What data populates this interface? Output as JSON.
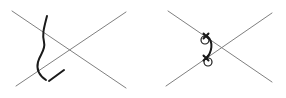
{
  "figure": {
    "title": "Two hand-drawn X-crossing diagrams",
    "background_color": "#ffffff",
    "width": 286,
    "height": 98,
    "panel_count": 2
  },
  "style": {
    "line_color": "#808080",
    "stroke_color": "#1a1a1a",
    "circle_stroke_color": "#1a1a1a",
    "circle_fill": "none",
    "line_width": 1.0,
    "stroke_width": 2.0,
    "circle_radius": 4.0
  },
  "panels": [
    {
      "id": "left-panel",
      "name": "wavy-stroke-panel",
      "label": "Left diagram: X crossing with wavy vertical stroke",
      "cross": {
        "name": "x-cross-left",
        "lines": [
          {
            "name": "descending-line",
            "x1": 12,
            "y1": 11,
            "x2": 126,
            "y2": 88,
            "direction": "top-left-to-bottom-right"
          },
          {
            "name": "ascending-line",
            "x1": 16,
            "y1": 86,
            "x2": 126,
            "y2": 12,
            "direction": "bottom-left-to-top-right"
          }
        ],
        "intersection": {
          "x": 70,
          "y": 50
        }
      },
      "annotation": {
        "name": "wavy-vertical-stroke",
        "type": "freehand-curve",
        "description": "Heavy black S-shaped vertical stroke crossing both lines",
        "path": "M 47 16 C 44 28, 42 34, 44 42 C 46 50, 40 54, 38 62 C 36 70, 40 76, 46 80",
        "endpoint": {
          "x": 46,
          "y": 80
        }
      },
      "tick": {
        "name": "diagonal-tick-mark",
        "type": "short-diagonal-marker",
        "description": "Small elongated diagonal tick near the curve endpoint",
        "x1": 49,
        "y1": 81,
        "x2": 64,
        "y2": 70
      }
    },
    {
      "id": "right-panel",
      "name": "circles-arc-panel",
      "label": "Right diagram: X crossing with two marked circles joined by an arc",
      "cross": {
        "name": "x-cross-right",
        "lines": [
          {
            "name": "descending-line",
            "x1": 168,
            "y1": 11,
            "x2": 272,
            "y2": 82,
            "direction": "top-left-to-bottom-right"
          },
          {
            "name": "ascending-line",
            "x1": 166,
            "y1": 86,
            "x2": 272,
            "y2": 13,
            "direction": "bottom-left-to-top-right"
          }
        ],
        "intersection": {
          "x": 217,
          "y": 50
        }
      },
      "markers": [
        {
          "name": "circle-marker-top",
          "circle": {
            "cx": 205,
            "cy": 40,
            "r": 4
          },
          "cross_mark": {
            "cx": 206,
            "cy": 36,
            "size": 5
          },
          "on_line": "descending-line"
        },
        {
          "name": "circle-marker-bottom",
          "circle": {
            "cx": 208,
            "cy": 62,
            "r": 4
          },
          "cross_mark": {
            "cx": 206,
            "cy": 58,
            "size": 5
          },
          "on_line": "descending-line"
        }
      ],
      "arc": {
        "name": "connecting-arc",
        "type": "curved-stroke",
        "description": "Black arc bulging leftward connecting the two circle markers",
        "path": "M 207 36 C 214 42, 212 52, 206 59",
        "from": "circle-marker-top",
        "to": "circle-marker-bottom"
      }
    }
  ]
}
